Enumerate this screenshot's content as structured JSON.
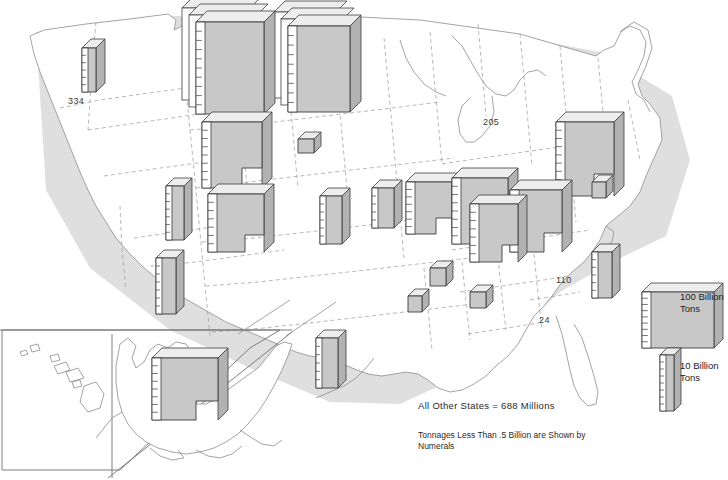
{
  "figure": {
    "type": "prism-map",
    "title_visible": false,
    "unit": "Billion Tons",
    "background_color": "#ffffff",
    "slab_face_color": "#c8c8c8",
    "slab_top_color": "#ededed",
    "slab_edge_color": "#3c3c3c",
    "state_outline_color": "#8d8d8d",
    "state_dash_color": "#9a9a9a",
    "text_color": "#1d1d1d"
  },
  "legend": {
    "items": [
      {
        "id": "legend-100",
        "label": "100 Billion\nTons",
        "value": 100,
        "unit": "Billion Tons",
        "x": 642,
        "y": 292,
        "w": 72,
        "h": 56,
        "depth": 9
      },
      {
        "id": "legend-10",
        "label": "10 Billion\nTons",
        "value": 10,
        "unit": "Billion Tons",
        "x": 660,
        "y": 355,
        "w": 14,
        "h": 56,
        "depth": 7
      }
    ],
    "label_positions": [
      {
        "for": "legend-100",
        "x": 680,
        "y": 292
      },
      {
        "for": "legend-10",
        "x": 680,
        "y": 362
      }
    ]
  },
  "notes": [
    {
      "id": "all-other-states",
      "text": "All Other States  =  688 Millions",
      "x": 418,
      "y": 402,
      "size": "big"
    },
    {
      "id": "numeral-note",
      "text": "Tonnages Less Than .5 Billion are Shown by\nNumerals",
      "x": 418,
      "y": 432,
      "size": "small"
    }
  ],
  "numerals": [
    {
      "id": "numeral-idaho",
      "state": "Idaho",
      "text": "334",
      "unit": "Millions",
      "x": 68,
      "y": 97
    },
    {
      "id": "numeral-michigan",
      "state": "Michigan",
      "text": "205",
      "unit": "Millions",
      "x": 483,
      "y": 118
    },
    {
      "id": "numeral-northcarolina",
      "state": "North Carolina",
      "text": "110",
      "unit": "Millions",
      "x": 556,
      "y": 276
    },
    {
      "id": "numeral-georgia",
      "state": "Georgia",
      "text": "24",
      "unit": "Millions",
      "x": 539,
      "y": 316
    }
  ],
  "chart_data": {
    "type": "bar",
    "title": "",
    "xlabel": "",
    "ylabel": "Billion Tons",
    "units": "Billion Tons",
    "legend_position": "right",
    "grid": false,
    "note": "Prism/slab map: slab face area encodes reserve tonnage; tick marks on the left edge of each slab read the height scale.",
    "categories": [
      "Montana",
      "North Dakota",
      "Wyoming",
      "Illinois",
      "Colorado",
      "Utah",
      "New Mexico",
      "Indiana",
      "Kentucky",
      "West Virginia",
      "Pennsylvania",
      "Ohio",
      "Missouri",
      "Iowa",
      "Kansas",
      "Oklahoma",
      "Arkansas",
      "Alabama",
      "Texas",
      "Virginia",
      "Tennessee",
      "Alaska",
      "Washington",
      "Idaho",
      "Michigan",
      "North Carolina",
      "Georgia",
      "All Other States"
    ],
    "values": [
      222,
      180,
      136,
      139,
      81,
      40,
      14,
      33,
      66,
      103,
      84,
      46,
      23,
      7,
      19,
      5,
      2,
      14,
      11,
      10,
      3,
      130,
      2,
      0.334,
      0.205,
      0.11,
      0.024,
      0.688
    ],
    "slabs": [
      {
        "id": "slab-washington",
        "state": "Washington",
        "x": 82,
        "y": 48,
        "w": 14,
        "h": 44,
        "depth": 9,
        "ticks": 6,
        "style": "column"
      },
      {
        "id": "slab-montana",
        "state": "Montana",
        "x": 196,
        "y": 22,
        "w": 68,
        "h": 92,
        "depth": 11,
        "ticks": 10,
        "style": "stack",
        "layers": 3
      },
      {
        "id": "slab-northdakota",
        "state": "North Dakota",
        "x": 288,
        "y": 26,
        "w": 62,
        "h": 86,
        "depth": 11,
        "ticks": 9,
        "style": "stack",
        "layers": 3
      },
      {
        "id": "slab-wyoming",
        "state": "Wyoming",
        "x": 202,
        "y": 122,
        "w": 60,
        "h": 66,
        "depth": 10,
        "ticks": 8,
        "style": "step"
      },
      {
        "id": "slab-colorado",
        "state": "Colorado",
        "x": 208,
        "y": 194,
        "w": 56,
        "h": 58,
        "depth": 10,
        "ticks": 7,
        "style": "step"
      },
      {
        "id": "slab-utah",
        "state": "Utah",
        "x": 166,
        "y": 186,
        "w": 18,
        "h": 54,
        "depth": 8,
        "ticks": 7,
        "style": "column"
      },
      {
        "id": "slab-newmexico",
        "state": "New Mexico",
        "x": 156,
        "y": 258,
        "w": 20,
        "h": 56,
        "depth": 8,
        "ticks": 7,
        "style": "column"
      },
      {
        "id": "slab-nebraska",
        "state": "Nebraska",
        "x": 298,
        "y": 139,
        "w": 16,
        "h": 14,
        "depth": 7,
        "ticks": 0,
        "style": "cube"
      },
      {
        "id": "slab-kansas",
        "state": "Kansas",
        "x": 320,
        "y": 196,
        "w": 22,
        "h": 48,
        "depth": 8,
        "ticks": 6,
        "style": "column"
      },
      {
        "id": "slab-iowa",
        "state": "Iowa",
        "x": 372,
        "y": 188,
        "w": 22,
        "h": 40,
        "depth": 8,
        "ticks": 5,
        "style": "column"
      },
      {
        "id": "slab-missouri",
        "state": "Missouri",
        "x": 406,
        "y": 182,
        "w": 46,
        "h": 52,
        "depth": 9,
        "ticks": 7,
        "style": "step"
      },
      {
        "id": "slab-illinois",
        "state": "Illinois",
        "x": 452,
        "y": 178,
        "w": 56,
        "h": 66,
        "depth": 10,
        "ticks": 8,
        "style": "step"
      },
      {
        "id": "slab-indiana",
        "state": "Indiana",
        "x": 470,
        "y": 204,
        "w": 48,
        "h": 58,
        "depth": 9,
        "ticks": 7,
        "style": "step"
      },
      {
        "id": "slab-kentucky",
        "state": "Kentucky",
        "x": 510,
        "y": 190,
        "w": 52,
        "h": 62,
        "depth": 10,
        "ticks": 8,
        "style": "step"
      },
      {
        "id": "slab-westvirginia",
        "state": "West Virginia",
        "x": 556,
        "y": 122,
        "w": 58,
        "h": 74,
        "depth": 10,
        "ticks": 9,
        "style": "step"
      },
      {
        "id": "slab-ohio",
        "state": "Ohio",
        "x": 592,
        "y": 252,
        "w": 20,
        "h": 46,
        "depth": 8,
        "ticks": 6,
        "style": "column"
      },
      {
        "id": "slab-virginia",
        "state": "Virginia",
        "x": 592,
        "y": 182,
        "w": 14,
        "h": 16,
        "depth": 7,
        "ticks": 0,
        "style": "cube"
      },
      {
        "id": "slab-tennessee",
        "state": "Tennessee",
        "x": 408,
        "y": 296,
        "w": 14,
        "h": 16,
        "depth": 7,
        "ticks": 0,
        "style": "cube"
      },
      {
        "id": "slab-alabama",
        "state": "Alabama",
        "x": 430,
        "y": 268,
        "w": 16,
        "h": 18,
        "depth": 7,
        "ticks": 0,
        "style": "cube"
      },
      {
        "id": "slab-arkansas",
        "state": "Arkansas",
        "x": 470,
        "y": 292,
        "w": 16,
        "h": 16,
        "depth": 7,
        "ticks": 0,
        "style": "cube"
      },
      {
        "id": "slab-texas",
        "state": "Texas",
        "x": 316,
        "y": 338,
        "w": 22,
        "h": 50,
        "depth": 8,
        "ticks": 6,
        "style": "column"
      },
      {
        "id": "slab-alaska",
        "state": "Alaska",
        "x": 152,
        "y": 358,
        "w": 66,
        "h": 62,
        "depth": 10,
        "ticks": 8,
        "style": "step"
      }
    ]
  }
}
